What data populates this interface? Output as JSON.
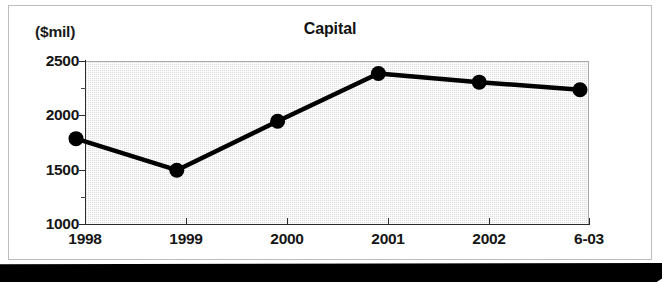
{
  "figure": {
    "title": "Capital",
    "unit_label": "($mil)"
  },
  "chart_data": {
    "type": "line",
    "title": "Capital",
    "xlabel": "",
    "ylabel": "($mil)",
    "unit": "$mil",
    "categories": [
      "1998",
      "1999",
      "2000",
      "2001",
      "2002",
      "6-03"
    ],
    "values": [
      1730,
      1440,
      1890,
      2330,
      2250,
      2180
    ],
    "series": [
      {
        "name": "Capital",
        "values": [
          1730,
          1440,
          1890,
          2330,
          2250,
          2180
        ]
      }
    ],
    "ylim": [
      1000,
      2500
    ],
    "ytick_labels": [
      "2500",
      "2000",
      "1500",
      "1000"
    ],
    "ytick_values": [
      2500,
      2000,
      1500,
      1000
    ],
    "yminor_values": [
      2250,
      1750,
      1250
    ],
    "xtick_labels": [
      "1998",
      "1999",
      "2000",
      "2001",
      "2002",
      "6-03"
    ],
    "grid": false,
    "legend": "none",
    "marker": "filled-circle",
    "line_color": "#000000",
    "plot_background": "#dededd"
  }
}
